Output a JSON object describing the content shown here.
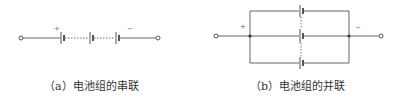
{
  "figures": [
    {
      "id": "a",
      "caption": "（a）电池组的串联",
      "type": "series",
      "plus_label": "+",
      "minus_label": "−",
      "battery_count_shown": 3
    },
    {
      "id": "b",
      "caption": "（b）电池组的并联",
      "type": "parallel",
      "plus_label": "+",
      "minus_label": "−",
      "battery_count_shown": 3
    }
  ],
  "colors": {
    "wire": "#555555",
    "text": "#333333",
    "background": "#ffffff"
  }
}
